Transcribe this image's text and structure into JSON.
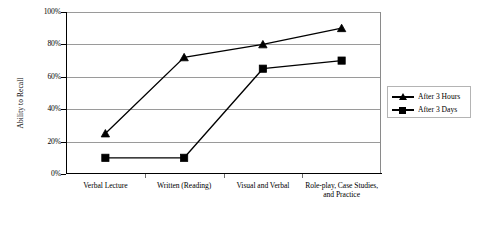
{
  "chart_data": {
    "type": "line",
    "title": "",
    "xlabel": "",
    "ylabel": "Ability to Recall",
    "categories": [
      "Verbal Lecture",
      "Written (Reading)",
      "Visual and Verbal",
      "Role-play, Case Studies, and Practice"
    ],
    "series": [
      {
        "name": "After 3 Hours",
        "marker": "triangle",
        "values": [
          25,
          72,
          80,
          90
        ]
      },
      {
        "name": "After 3 Days",
        "marker": "square",
        "values": [
          10,
          10,
          65,
          70
        ]
      }
    ],
    "ylim": [
      0,
      100
    ],
    "y_ticks": [
      "0%",
      "20%",
      "40%",
      "60%",
      "80%",
      "100%"
    ],
    "y_tick_values": [
      0,
      20,
      40,
      60,
      80,
      100
    ],
    "grid": true,
    "legend_position": "right",
    "colors": {
      "series_line": "#000000",
      "gridline": "#9a9a9a",
      "axis": "#000000",
      "background": "#ffffff",
      "legend_border": "#b4b4b4"
    }
  },
  "legend": {
    "entries": [
      {
        "label": "After 3 Hours",
        "marker": "triangle-marker"
      },
      {
        "label": "After 3 Days",
        "marker": "square-marker"
      }
    ]
  }
}
